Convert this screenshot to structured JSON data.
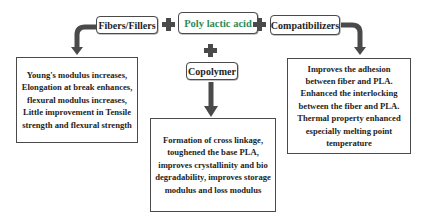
{
  "diagram": {
    "center_node": {
      "label": "Poly lactic acid",
      "color": "#2e8b57"
    },
    "components": [
      {
        "label": "Fibers/Fillers",
        "effect": "Young's modulus increases, Elongation at break enhances, flexural modulus increases, Little improvement in Tensile strength and flexural strength"
      },
      {
        "label": "Copolymer",
        "effect": "Formation of cross linkage, toughened the base PLA, improves crystallinity and bio degradability, improves storage modulus and loss modulus"
      },
      {
        "label": "Compatibilizers",
        "effect": "Improves the adhesion between fiber and PLA. Enhanced the interlocking between the fiber and PLA. Thermal property enhanced especially melting point temperature"
      }
    ],
    "connectors": [
      "plus",
      "plus",
      "plus"
    ],
    "colors": {
      "border": "#4a4a4a",
      "arrow": "#4a4a4a",
      "text": "#1e1e1e",
      "accent": "#2e8b57"
    }
  }
}
